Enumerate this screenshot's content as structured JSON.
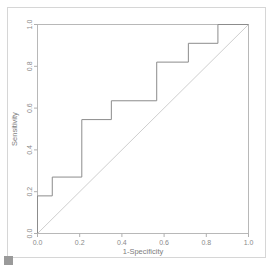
{
  "figure": {
    "kind": "roc-curve-plot",
    "background_color": "#ffffff",
    "frame_color": "#d6d6d6",
    "curve_color": "#8c8c8c",
    "reference_line_color": "#cfcfcf",
    "axis_color": "#b0b0b0",
    "text_color": "#8a8a8a"
  },
  "chart_data": {
    "type": "line",
    "title": "",
    "subtitle": "",
    "xlabel": "1-Specificity",
    "ylabel": "Sensitivity",
    "xlim": [
      0.0,
      1.0
    ],
    "ylim": [
      0.0,
      1.0
    ],
    "xticks": [
      0.0,
      0.2,
      0.4,
      0.6,
      0.8,
      1.0
    ],
    "yticks": [
      0.0,
      0.2,
      0.4,
      0.6,
      0.8,
      1.0
    ],
    "xticklabels": [
      "0.0",
      "0.2",
      "0.4",
      "0.6",
      "0.8",
      "1.0"
    ],
    "yticklabels": [
      "0.0",
      "0.2",
      "0.4",
      "0.6",
      "0.8",
      "1.0"
    ],
    "grid": false,
    "legend": null,
    "drawstyle": "steps-post",
    "series": [
      {
        "name": "ROC curve",
        "color": "#8c8c8c",
        "linewidth": 1,
        "x": [
          0.0,
          0.0,
          0.07,
          0.07,
          0.21,
          0.21,
          0.35,
          0.35,
          0.565,
          0.565,
          0.715,
          0.715,
          0.855,
          0.855,
          1.0
        ],
        "y": [
          0.0,
          0.18,
          0.18,
          0.27,
          0.27,
          0.545,
          0.545,
          0.635,
          0.635,
          0.82,
          0.82,
          0.91,
          0.91,
          1.0,
          1.0
        ]
      },
      {
        "name": "Chance reference line",
        "color": "#cfcfcf",
        "linewidth": 1,
        "x": [
          0.0,
          1.0
        ],
        "y": [
          0.0,
          1.0
        ]
      }
    ]
  }
}
